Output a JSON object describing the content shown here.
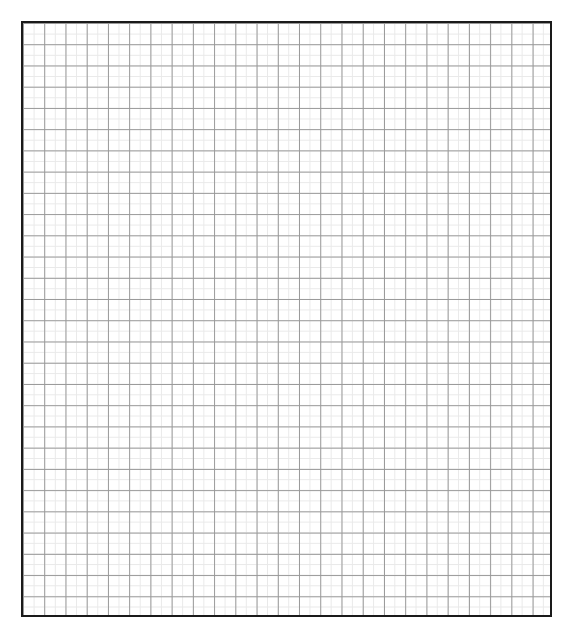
{
  "document": {
    "title": "Graph Paper Grid",
    "background_color": "#ffffff",
    "width": 573,
    "height": 642
  },
  "chart_data": {
    "type": "grid",
    "title": "",
    "subtitle": "",
    "xlabel": "",
    "ylabel": "",
    "series": [],
    "categories": [],
    "values": [],
    "annotations": [],
    "legend": {
      "entries": [],
      "position": "none",
      "visible": false
    },
    "axes": {
      "x": {
        "visible_ticks": false,
        "tick_labels": [],
        "range": [
          0,
          25
        ]
      },
      "y": {
        "visible_ticks": false,
        "tick_labels": [],
        "range": [
          0,
          28
        ]
      }
    },
    "grid": {
      "visible": true,
      "major_columns": 25,
      "major_rows": 28,
      "major_spacing_px": 21.24,
      "minor_per_major": 2,
      "minor_spacing_px": 10.62,
      "major_color": "#989898",
      "minor_color": "#e9e9e9",
      "major_line_width_px": 1,
      "minor_line_width_px": 1
    }
  },
  "grid_panel": {
    "name": "graph-paper",
    "left": 21,
    "top": 21,
    "width": 531,
    "height": 596,
    "border_color": "#1a1a1a",
    "border_width_px": 2,
    "fill_color": "#ffffff"
  }
}
